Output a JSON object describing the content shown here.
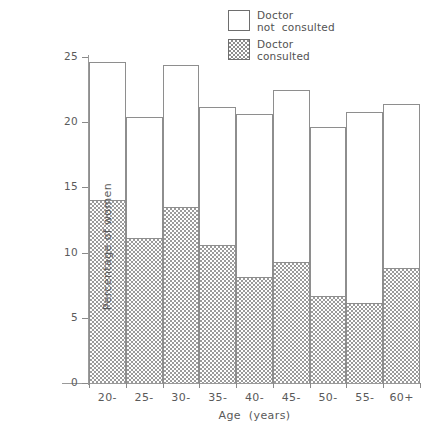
{
  "chart_data": {
    "type": "bar",
    "title": "",
    "subtitle": "",
    "xlabel": "Age  (years)",
    "ylabel": "Percentage of women",
    "categories": [
      "20-",
      "25-",
      "30-",
      "35-",
      "40-",
      "45-",
      "50-",
      "55-",
      "60+"
    ],
    "series": [
      {
        "name": "Doctor consulted",
        "values": [
          14.0,
          11.1,
          13.5,
          10.6,
          8.1,
          9.3,
          6.7,
          6.1,
          8.8
        ]
      },
      {
        "name": "Doctor not consulted",
        "values": [
          10.6,
          9.3,
          10.9,
          10.6,
          12.5,
          13.2,
          12.9,
          14.7,
          12.6
        ]
      }
    ],
    "totals": [
      24.6,
      20.4,
      24.4,
      21.2,
      20.6,
      22.5,
      19.6,
      20.8,
      21.4
    ],
    "stacked": true,
    "ylim": [
      0,
      25
    ],
    "yticks": [
      0,
      5,
      10,
      15,
      20,
      25
    ],
    "ytick_labels": [
      "0",
      "5",
      "10",
      "15",
      "20",
      "25"
    ],
    "grid": false,
    "legend_position": "top-center"
  },
  "legend": {
    "items": [
      {
        "swatch": "white-square",
        "line1": "Doctor",
        "line2": "not  consulted"
      },
      {
        "swatch": "hatched-square",
        "line1": "Doctor",
        "line2": "consulted"
      }
    ]
  },
  "axes": {
    "y_title": "Percentage of women",
    "x_title": "Age  (years)",
    "y_tick_labels": [
      "25",
      "20",
      "15",
      "10",
      "5",
      "0"
    ],
    "x_tick_labels": [
      "20-",
      "25-",
      "30-",
      "35-",
      "40-",
      "45-",
      "50-",
      "55-",
      "60+"
    ]
  },
  "colors": {
    "axis": "#9a9a9a",
    "bar_outline": "#8e8e8e",
    "hatch": "#9b9b9b",
    "background": "#ffffff",
    "text": "#5a5a5a"
  }
}
